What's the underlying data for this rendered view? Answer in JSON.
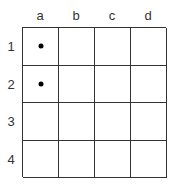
{
  "columns": [
    "a",
    "b",
    "c",
    "d"
  ],
  "rows": [
    "1",
    "2",
    "3",
    "4"
  ],
  "marked_cells": [
    {
      "row": "1",
      "col": "a",
      "marker": "dot"
    },
    {
      "row": "2",
      "col": "a",
      "marker": "dot"
    }
  ]
}
